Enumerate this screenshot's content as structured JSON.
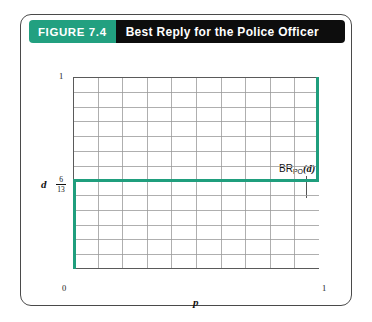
{
  "figure": {
    "number_label": "FIGURE 7.4",
    "title": "Best Reply for the Police Officer",
    "accent_color": "#22a080",
    "header_bg": "#0d0d0d",
    "line_color": "#1f9e7d"
  },
  "annotation": {
    "prefix": "BR",
    "subscript": "PO",
    "argument": "(d)"
  },
  "axes": {
    "x_label": "p",
    "y_label": "d",
    "x_ticks": [
      "0",
      "1"
    ],
    "y_tick_top": "1",
    "y_tick_value_numerator": "6",
    "y_tick_value_denominator": "13"
  },
  "chart_data": {
    "type": "line",
    "title": "Best Reply for the Police Officer",
    "xlabel": "p",
    "ylabel": "d",
    "xlim": [
      0,
      1
    ],
    "ylim": [
      0,
      1
    ],
    "x_tick_labels": [
      "0",
      "1"
    ],
    "y_tick_labels": [
      "6/13",
      "1"
    ],
    "y_tick_values": [
      0.4615,
      1
    ],
    "grid": true,
    "grid_columns": 10,
    "grid_rows": 13,
    "legend": "none",
    "series": [
      {
        "name": "BR_PO(d)",
        "description": "Best reply correspondence of the Police Officer: p = 0 for d < 6/13, the whole interval [0,1] at d = 6/13, and p = 1 for d > 6/13",
        "segments": [
          {
            "kind": "vertical",
            "x": 0,
            "y_from": 0,
            "y_to": 0.4615
          },
          {
            "kind": "horizontal",
            "y": 0.4615,
            "x_from": 0,
            "x_to": 1
          },
          {
            "kind": "vertical",
            "x": 1,
            "y_from": 0.4615,
            "y_to": 1
          }
        ]
      }
    ],
    "annotations": [
      {
        "text": "BR_PO(d)",
        "x": 0.87,
        "y": 0.62,
        "points_to": {
          "x": 0.87,
          "y": 0.4615
        }
      }
    ]
  }
}
